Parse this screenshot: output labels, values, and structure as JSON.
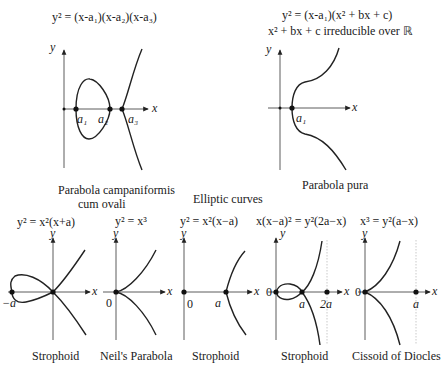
{
  "title": "Elliptic curves",
  "top": [
    {
      "equation": "y² = (x-a₁)(x-a₂)(x-a₃)",
      "caption_line1": "Parabola campaniformis",
      "caption_line2": "cum ovali",
      "points": [
        "a₁",
        "a₂",
        "a₃"
      ],
      "axis_x": "x",
      "axis_y": "y"
    },
    {
      "equation": "y² = (x-a₁)(x² + bx + c)",
      "condition": "x² + bx + c irreducible over ℝ",
      "caption": "Parabola pura",
      "points": [
        "a₁"
      ],
      "axis_x": "x",
      "axis_y": "y"
    }
  ],
  "bottom": [
    {
      "equation": "y² = x²(x+a)",
      "caption": "Strophoid",
      "points": [
        "−a"
      ],
      "axis_x": "x",
      "axis_y": "y"
    },
    {
      "equation": "y² = x³",
      "caption": "Neil's Parabola",
      "points": [
        "0"
      ],
      "axis_x": "x",
      "axis_y": "y"
    },
    {
      "equation": "y² = x²(x−a)",
      "caption": "Strophoid",
      "points": [
        "0",
        "a"
      ],
      "axis_x": "x",
      "axis_y": "y"
    },
    {
      "equation": "x(x−a)² = y²(2a−x)",
      "caption": "Strophoid",
      "points": [
        "0",
        "a",
        "2a"
      ],
      "axis_x": "x",
      "axis_y": "y"
    },
    {
      "equation": "x³ = y²(a−x)",
      "caption": "Cissoid of Diocles",
      "points": [
        "0",
        "a"
      ],
      "axis_x": "x",
      "axis_y": "y"
    }
  ]
}
